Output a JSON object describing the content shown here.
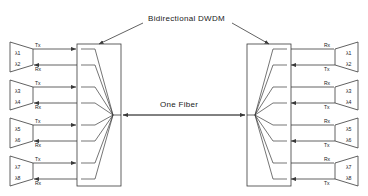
{
  "diagram": {
    "title": "Bidirectional DWDM",
    "fiber_label": "One Fiber",
    "left_node_label": "left-dwdm-multiplexer",
    "right_node_label": "right-dwdm-multiplexer",
    "line_color": "#3a3a3a",
    "text_color": "#1a1a1a",
    "background": "#ffffff"
  },
  "left_terminals": [
    {
      "lambda_top": "λ1",
      "lambda_bottom": "λ2",
      "port_top": "Tx",
      "port_bottom": "Rx"
    },
    {
      "lambda_top": "λ3",
      "lambda_bottom": "λ4",
      "port_top": "Tx",
      "port_bottom": "Rx"
    },
    {
      "lambda_top": "λ5",
      "lambda_bottom": "λ6",
      "port_top": "Tx",
      "port_bottom": "Rx"
    },
    {
      "lambda_top": "λ7",
      "lambda_bottom": "λ8",
      "port_top": "Tx",
      "port_bottom": "Rx"
    }
  ],
  "right_terminals": [
    {
      "lambda_top": "λ1",
      "lambda_bottom": "λ2",
      "port_top": "Rx",
      "port_bottom": "Tx"
    },
    {
      "lambda_top": "λ3",
      "lambda_bottom": "λ4",
      "port_top": "Rx",
      "port_bottom": "Tx"
    },
    {
      "lambda_top": "λ5",
      "lambda_bottom": "λ6",
      "port_top": "Rx",
      "port_bottom": "Tx"
    },
    {
      "lambda_top": "λ7",
      "lambda_bottom": "λ8",
      "port_top": "Rx",
      "port_bottom": "Tx"
    }
  ]
}
